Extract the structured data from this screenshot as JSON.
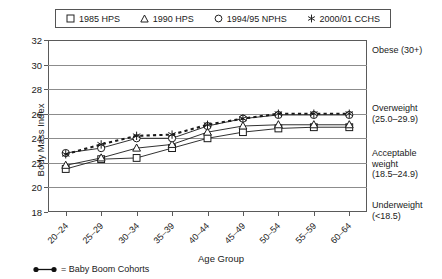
{
  "legend": {
    "items": [
      {
        "label": "1985 HPS",
        "marker": "square-marker-icon"
      },
      {
        "label": "1990 HPS",
        "marker": "triangle-marker-icon"
      },
      {
        "label": "1994/95 NPHS",
        "marker": "circle-marker-icon"
      },
      {
        "label": "2000/01 CCHS",
        "marker": "asterisk-marker-icon"
      }
    ]
  },
  "axes": {
    "ylabel": "Body Mass Index",
    "xlabel": "Age Group"
  },
  "annotations": [
    {
      "name": "obese",
      "text": "Obese (30+)"
    },
    {
      "name": "overweight",
      "text": "Overweight\n(25.0–29.9)"
    },
    {
      "name": "acceptable",
      "text": "Acceptable\nweight\n(18.5–24.9)"
    },
    {
      "name": "underweight",
      "text": "Underweight\n(<18.5)"
    }
  ],
  "footnote": {
    "text": "= Baby Boom Cohorts",
    "symbol": "baby-boom-line-icon"
  },
  "chart_data": {
    "type": "line",
    "title": "",
    "xlabel": "Age Group",
    "ylabel": "Body Mass Index",
    "ylim": [
      18,
      32
    ],
    "yticks": [
      18,
      20,
      22,
      24,
      26,
      28,
      30,
      32
    ],
    "grid": true,
    "legend_position": "top",
    "categories": [
      "20–24",
      "25–29",
      "30–34",
      "35–39",
      "40–44",
      "45–49",
      "50–54",
      "55–59",
      "60–64"
    ],
    "series": [
      {
        "name": "1985 HPS",
        "marker": "square",
        "linestyle": "solid",
        "values": [
          21.5,
          22.3,
          22.4,
          23.2,
          24.0,
          24.5,
          24.8,
          24.9,
          24.9
        ]
      },
      {
        "name": "1990 HPS",
        "marker": "triangle",
        "linestyle": "solid",
        "values": [
          21.8,
          22.4,
          23.2,
          23.5,
          24.5,
          25.0,
          25.1,
          25.1,
          25.1
        ]
      },
      {
        "name": "1994/95 NPHS",
        "marker": "circle",
        "linestyle": "solid",
        "values": [
          22.8,
          23.2,
          24.0,
          24.0,
          25.0,
          25.6,
          25.9,
          25.9,
          25.9
        ]
      },
      {
        "name": "2000/01 CCHS",
        "marker": "asterisk",
        "linestyle": "dashed",
        "values": [
          22.7,
          23.5,
          24.2,
          24.3,
          25.1,
          25.6,
          26.0,
          26.0,
          26.0
        ]
      }
    ]
  }
}
